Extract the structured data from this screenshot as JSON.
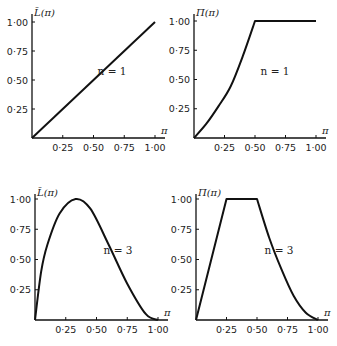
{
  "chart_data": [
    {
      "type": "line",
      "id": "top-left",
      "ylabel": "L̄(π)",
      "xlabel": "π",
      "annotation": "n = 1",
      "x_ticks": [
        "0·25",
        "0·50",
        "0·75",
        "1·00"
      ],
      "y_ticks": [
        "0·25",
        "0·50",
        "0·75",
        "1·00"
      ],
      "xlim": [
        0,
        1
      ],
      "ylim": [
        0,
        1.05
      ],
      "x": [
        0,
        0.25,
        0.5,
        0.75,
        1.0
      ],
      "values": [
        0,
        0.25,
        0.5,
        0.75,
        1.0
      ]
    },
    {
      "type": "line",
      "id": "top-right",
      "ylabel": "Π(π)",
      "xlabel": "π",
      "annotation": "n = 1",
      "x_ticks": [
        "0·25",
        "0·50",
        "0·75",
        "1·00"
      ],
      "y_ticks": [
        "0·25",
        "0·50",
        "0·75",
        "1·00"
      ],
      "xlim": [
        0,
        1
      ],
      "ylim": [
        0,
        1.05
      ],
      "x": [
        0,
        0.1,
        0.2,
        0.3,
        0.4,
        0.5,
        0.75,
        1.0
      ],
      "values": [
        0,
        0.12,
        0.27,
        0.44,
        0.7,
        1.0,
        1.0,
        1.0
      ]
    },
    {
      "type": "line",
      "id": "bottom-left",
      "ylabel": "L̄(π)",
      "xlabel": "π",
      "annotation": "n = 3",
      "x_ticks": [
        "0·25",
        "0·50",
        "0·75",
        "1·00"
      ],
      "y_ticks": [
        "0·25",
        "0·50",
        "0·75",
        "1·00"
      ],
      "xlim": [
        0,
        1
      ],
      "ylim": [
        0,
        1.05
      ],
      "x": [
        0,
        0.05,
        0.1,
        0.2,
        0.33,
        0.45,
        0.6,
        0.75,
        0.9,
        1.0
      ],
      "values": [
        0,
        0.4,
        0.62,
        0.88,
        1.0,
        0.92,
        0.62,
        0.3,
        0.05,
        0
      ]
    },
    {
      "type": "line",
      "id": "bottom-right",
      "ylabel": "Π(π)",
      "xlabel": "π",
      "annotation": "n = 3",
      "x_ticks": [
        "0·25",
        "0·50",
        "0·75",
        "1·00"
      ],
      "y_ticks": [
        "0·25",
        "0·50",
        "0·75",
        "1·00"
      ],
      "xlim": [
        0,
        1
      ],
      "ylim": [
        0,
        1.05
      ],
      "x": [
        0,
        0.25,
        0.5,
        0.6,
        0.7,
        0.8,
        0.9,
        1.0
      ],
      "values": [
        0,
        1.0,
        1.0,
        0.68,
        0.42,
        0.2,
        0.06,
        0
      ]
    }
  ]
}
